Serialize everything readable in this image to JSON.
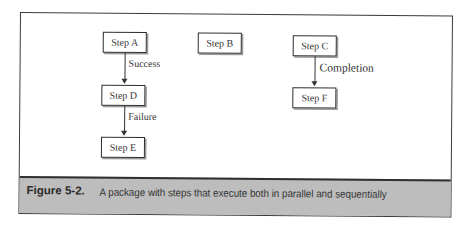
{
  "diagram": {
    "steps": [
      {
        "id": "A",
        "label": "Step A"
      },
      {
        "id": "B",
        "label": "Step B"
      },
      {
        "id": "C",
        "label": "Step C"
      },
      {
        "id": "D",
        "label": "Step D"
      },
      {
        "id": "E",
        "label": "Step E"
      },
      {
        "id": "F",
        "label": "Step F"
      }
    ],
    "edges": [
      {
        "from": "A",
        "to": "D",
        "label": "Success"
      },
      {
        "from": "D",
        "to": "E",
        "label": "Failure"
      },
      {
        "from": "C",
        "to": "F",
        "label": "Completion"
      }
    ]
  },
  "caption": {
    "figure_label": "Figure 5-2.",
    "text": "A package with steps that execute both in parallel and sequentially"
  }
}
